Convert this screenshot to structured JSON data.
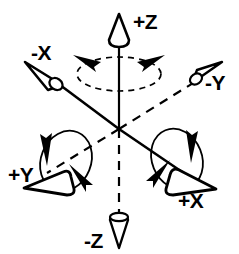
{
  "diagram": {
    "type": "3d-axis-orientation",
    "background_color": "#ffffff",
    "stroke_color": "#000000",
    "origin": {
      "x": 119,
      "y": 129
    },
    "axes": [
      {
        "id": "z-positive",
        "label": "+Z",
        "line_style": "solid",
        "direction": "up",
        "arrow_kind": "cone",
        "label_position": {
          "x": 133,
          "y": 26
        },
        "tip": {
          "x": 119,
          "y": 17
        },
        "base": {
          "x": 119,
          "y": 129
        }
      },
      {
        "id": "z-negative",
        "label": "-Z",
        "line_style": "dashed",
        "direction": "down",
        "arrow_kind": "cone",
        "label_position": {
          "x": 88,
          "y": 243
        },
        "tip": {
          "x": 119,
          "y": 243
        },
        "base": {
          "x": 119,
          "y": 129
        }
      },
      {
        "id": "x-negative",
        "label": "-X",
        "line_style": "solid",
        "direction": "upper-left",
        "arrow_kind": "cone",
        "label_position": {
          "x": 31,
          "y": 52
        },
        "tip": {
          "x": 31,
          "y": 65
        },
        "base": {
          "x": 119,
          "y": 129
        }
      },
      {
        "id": "x-positive",
        "label": "+X",
        "line_style": "solid",
        "direction": "lower-right",
        "arrow_kind": "cone",
        "label_position": {
          "x": 180,
          "y": 201
        },
        "tip": {
          "x": 212,
          "y": 186
        },
        "base": {
          "x": 119,
          "y": 129
        }
      },
      {
        "id": "y-negative",
        "label": "-Y",
        "line_style": "dashed",
        "direction": "upper-right",
        "arrow_kind": "cone",
        "label_position": {
          "x": 208,
          "y": 86
        },
        "tip": {
          "x": 220,
          "y": 66
        },
        "base": {
          "x": 119,
          "y": 129
        }
      },
      {
        "id": "y-positive",
        "label": "+Y",
        "line_style": "dashed",
        "direction": "lower-left",
        "arrow_kind": "cone",
        "label_position": {
          "x": 12,
          "y": 177
        },
        "tip": {
          "x": 29,
          "y": 182
        },
        "base": {
          "x": 119,
          "y": 129
        }
      }
    ],
    "rotations": [
      {
        "id": "rotation-z",
        "about_axis": "Z",
        "style": "dashed-ellipse",
        "arrowheads": 2,
        "center": {
          "x": 119,
          "y": 72
        },
        "radius_x": 42,
        "radius_y": 17
      },
      {
        "id": "rotation-x",
        "about_axis": "X",
        "style": "solid-ellipse",
        "arrowheads": 2,
        "center": {
          "x": 177,
          "y": 160
        },
        "radius_x": 26,
        "radius_y": 31
      },
      {
        "id": "rotation-y",
        "about_axis": "Y",
        "style": "solid-ellipse",
        "arrowheads": 2,
        "center": {
          "x": 62,
          "y": 160
        },
        "radius_x": 26,
        "radius_y": 31
      }
    ]
  }
}
